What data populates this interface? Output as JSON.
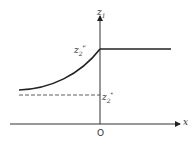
{
  "diagram": {
    "axes": {
      "y_label": "z",
      "y_label_sub": "1",
      "x_label": "x",
      "origin_label": "O"
    },
    "labels": {
      "upper_value": {
        "base": "z",
        "sub": "2",
        "sup": "*'"
      },
      "lower_value": {
        "base": "z",
        "sub": "2",
        "sup": "*"
      }
    },
    "colors": {
      "line": "#222222",
      "background": "#ffffff"
    }
  }
}
